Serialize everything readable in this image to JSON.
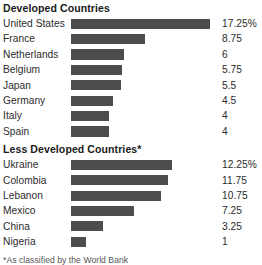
{
  "chart_data": {
    "type": "bar",
    "title": "",
    "xlabel": "",
    "ylabel": "",
    "orientation": "horizontal",
    "grid": false,
    "legend": false,
    "value_suffix": "%",
    "xlim": [
      0,
      17.25
    ],
    "groups": [
      {
        "name": "Developed Countries",
        "categories": [
          "United States",
          "France",
          "Netherlands",
          "Belgium",
          "Japan",
          "Germany",
          "Italy",
          "Spain"
        ],
        "values": [
          17.25,
          8.75,
          6,
          5.75,
          5.5,
          4.5,
          4,
          4
        ],
        "value_labels": [
          "17.25%",
          "8.75",
          "6",
          "5.75",
          "5.5",
          "4.5",
          "4",
          "4"
        ]
      },
      {
        "name": "Less Developed Countries*",
        "categories": [
          "Ukraine",
          "Colombia",
          "Lebanon",
          "Mexico",
          "China",
          "Nigeria"
        ],
        "values": [
          12.25,
          11.75,
          10.75,
          7.25,
          3.25,
          1
        ],
        "value_labels": [
          "12.25%",
          "11.75",
          "10.75",
          "7.25",
          "3.25",
          "1"
        ]
      }
    ]
  },
  "sections": [
    {
      "title": "Developed Countries",
      "rows": [
        {
          "label": "United States",
          "value": 17.25,
          "value_label": "17.25%"
        },
        {
          "label": "France",
          "value": 8.75,
          "value_label": "8.75"
        },
        {
          "label": "Netherlands",
          "value": 6,
          "value_label": "6"
        },
        {
          "label": "Belgium",
          "value": 5.75,
          "value_label": "5.75"
        },
        {
          "label": "Japan",
          "value": 5.5,
          "value_label": "5.5"
        },
        {
          "label": "Germany",
          "value": 4.5,
          "value_label": "4.5"
        },
        {
          "label": "Italy",
          "value": 4,
          "value_label": "4"
        },
        {
          "label": "Spain",
          "value": 4,
          "value_label": "4"
        }
      ]
    },
    {
      "title": "Less Developed Countries*",
      "rows": [
        {
          "label": "Ukraine",
          "value": 12.25,
          "value_label": "12.25%"
        },
        {
          "label": "Colombia",
          "value": 11.75,
          "value_label": "11.75"
        },
        {
          "label": "Lebanon",
          "value": 10.75,
          "value_label": "10.75"
        },
        {
          "label": "Mexico",
          "value": 7.25,
          "value_label": "7.25"
        },
        {
          "label": "China",
          "value": 3.25,
          "value_label": "3.25"
        },
        {
          "label": "Nigeria",
          "value": 1,
          "value_label": "1"
        }
      ]
    }
  ],
  "footnote": "*As classified by the World Bank",
  "colors": {
    "bar": "#4d4d4d",
    "text": "#2b2b2b",
    "title": "#1a1a1a",
    "background": "#ffffff"
  }
}
